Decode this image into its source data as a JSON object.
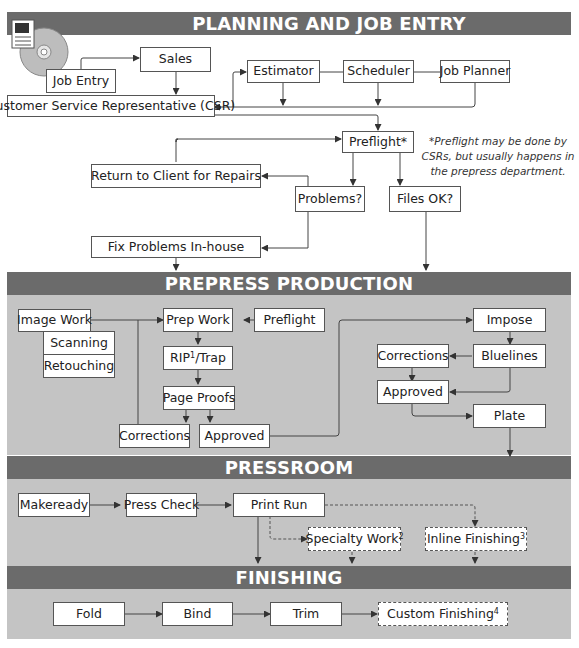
{
  "sections": {
    "planning": {
      "title": "PLANNING AND JOB ENTRY"
    },
    "prepress": {
      "title": "PREPRESS PRODUCTION"
    },
    "pressroom": {
      "title": "PRESSROOM"
    },
    "finishing": {
      "title": "FINISHING"
    }
  },
  "planning": {
    "job_entry": "Job Entry",
    "sales": "Sales",
    "csr": "Customer Service Representative (CSR)",
    "estimator": "Estimator",
    "scheduler": "Scheduler",
    "job_planner": "Job Planner",
    "preflight": "Preflight*",
    "return_to_client": "Return to Client for Repairs",
    "problems": "Problems?",
    "files_ok": "Files OK?",
    "fix_in_house": "Fix Problems In-house",
    "note": "*Preflight may be done by CSRs, but usually happens in the prepress department."
  },
  "prepress": {
    "image_work": "Image Work",
    "scanning": "Scanning",
    "retouching": "Retouching",
    "prep_work": "Prep Work",
    "preflight": "Preflight",
    "rip_prefix": "RIP",
    "rip_sup": "1",
    "rip_suffix": "/Trap",
    "page_proofs": "Page Proofs",
    "corrections_left": "Corrections",
    "approved_left": "Approved",
    "impose": "Impose",
    "bluelines": "Bluelines",
    "corrections_right": "Corrections",
    "approved_right": "Approved",
    "plate": "Plate"
  },
  "pressroom": {
    "makeready": "Makeready",
    "press_check": "Press Check",
    "print_run": "Print Run",
    "specialty_work": "Specialty Work",
    "specialty_sup": "2",
    "inline_finishing": "Inline Finishing",
    "inline_sup": "3"
  },
  "finishing": {
    "fold": "Fold",
    "bind": "Bind",
    "trim": "Trim",
    "custom_finishing": "Custom Finishing",
    "custom_sup": "4"
  },
  "colors": {
    "band": "#6b6b6b",
    "panel": "#c4c4c4",
    "line": "#444444"
  }
}
